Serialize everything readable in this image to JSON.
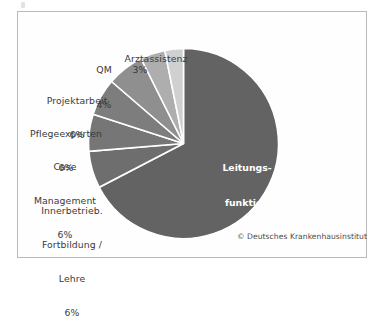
{
  "figure": {
    "credit": "© Deutsches Krankenhausinstitut",
    "frame_color": "#b9b9b9",
    "background": "#ffffff"
  },
  "chart_data": {
    "type": "pie",
    "title": "",
    "units": "percent",
    "legend_position": "none",
    "labels_outside": true,
    "total": 95,
    "categories": [
      "Leitungsfunktion",
      "Innerbetrieb. Fortbildung / Lehre",
      "Case Management",
      "Pflegeexperten",
      "Projektarbeit",
      "QM",
      "Arztassistenz"
    ],
    "values": [
      64,
      6,
      6,
      6,
      6,
      4,
      3
    ],
    "slices": [
      {
        "name": "Leitungsfunktion",
        "label_line1": "Leitungs-",
        "label_line2": "funktion",
        "value_label": "64%",
        "value": 64,
        "color": "#636363",
        "label_placement": "inside"
      },
      {
        "name": "Innerbetrieb. Fortbildung / Lehre",
        "label_line1": "Innerbetrieb.",
        "label_line2": "Fortbildung /",
        "label_line3": "Lehre",
        "value_label": "6%",
        "value": 6,
        "color": "#6e6e6e",
        "label_placement": "outside"
      },
      {
        "name": "Case Management",
        "label_line1": "Case",
        "label_line2": "Management",
        "value_label": "6%",
        "value": 6,
        "color": "#767676",
        "label_placement": "outside"
      },
      {
        "name": "Pflegeexperten",
        "label_line1": "Pflegeexperten",
        "value_label": "6%",
        "value": 6,
        "color": "#7d7d7d",
        "label_placement": "outside"
      },
      {
        "name": "Projektarbeit",
        "label_line1": "Projektarbeit",
        "value_label": "6%",
        "value": 6,
        "color": "#8f8f8f",
        "label_placement": "outside"
      },
      {
        "name": "QM",
        "label_line1": "QM",
        "value_label": "4%",
        "value": 4,
        "color": "#aeaeae",
        "label_placement": "outside"
      },
      {
        "name": "Arztassistenz",
        "label_line1": "Arztassistenz",
        "value_label": "3%",
        "value": 3,
        "color": "#d0d0d0",
        "label_placement": "outside"
      }
    ]
  }
}
